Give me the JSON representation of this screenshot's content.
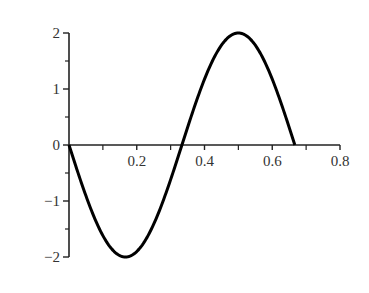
{
  "chart_data": {
    "type": "line",
    "title": "",
    "xlabel": "",
    "ylabel": "",
    "xlim": [
      0,
      0.8
    ],
    "ylim": [
      -2,
      2
    ],
    "grid": false,
    "legend": null,
    "x_ticks": [
      0.2,
      0.4,
      0.6,
      0.8
    ],
    "x_tick_labels": [
      "0.2",
      "0.4",
      "0.6",
      "0.8"
    ],
    "x_minor_ticks": [
      0.1,
      0.3,
      0.5,
      0.7
    ],
    "y_ticks": [
      2,
      1,
      0,
      -1,
      -2
    ],
    "y_tick_labels": [
      "2",
      "1",
      "0",
      "−1",
      "−2"
    ],
    "y_minor_ticks": [
      1.5,
      0.5,
      -0.5,
      -1.5
    ],
    "series": [
      {
        "name": "y = -2 sin(3πx)",
        "color": "#000000",
        "x": [
          0,
          0.05,
          0.1,
          0.1667,
          0.2,
          0.25,
          0.3,
          0.3333,
          0.35,
          0.4,
          0.45,
          0.5,
          0.55,
          0.6,
          0.65,
          0.6667
        ],
        "y": [
          0,
          -0.91,
          -1.62,
          -2.0,
          -1.9,
          -1.41,
          -0.62,
          0,
          0.31,
          1.18,
          1.78,
          2.0,
          1.78,
          1.18,
          0.31,
          0
        ]
      }
    ]
  }
}
